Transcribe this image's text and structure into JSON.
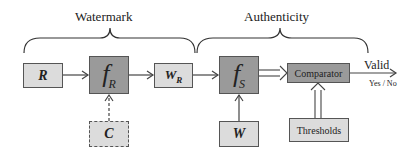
{
  "braces": {
    "watermark": "Watermark",
    "authenticity": "Authenticity"
  },
  "nodes": {
    "r": {
      "label": "R"
    },
    "f_r": {
      "symbol": "f",
      "sub": "R"
    },
    "c": {
      "label": "C"
    },
    "w_r": {
      "label": "W",
      "sub": "R"
    },
    "f_s": {
      "symbol": "f",
      "sub": "S"
    },
    "w": {
      "label": "W"
    },
    "comparator": {
      "label": "Comparator"
    },
    "thresholds": {
      "label": "Thresholds"
    }
  },
  "output": {
    "label": "Valid",
    "values": "Yes / No"
  },
  "colors": {
    "light_box": "#dcdcdc",
    "dark_box": "#9a9a9a",
    "stroke": "#555555"
  }
}
